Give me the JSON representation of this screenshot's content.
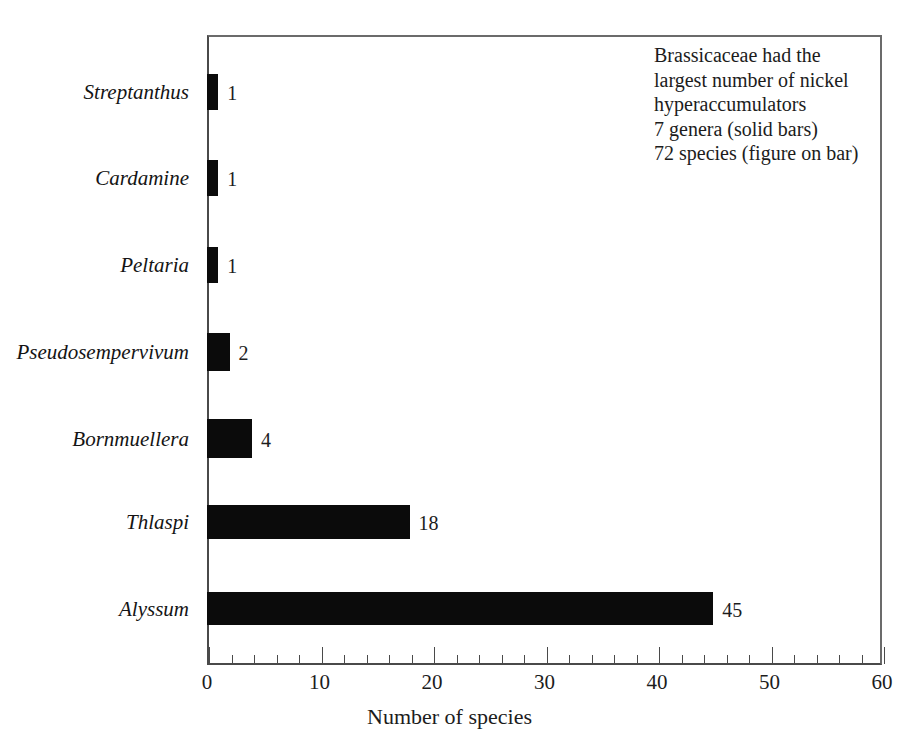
{
  "chart_data": {
    "type": "bar",
    "orientation": "horizontal",
    "title": "",
    "xlabel": "Number of species",
    "ylabel": "",
    "xlim": [
      0,
      60
    ],
    "ylim": null,
    "grid": false,
    "legend": null,
    "x_major_step": 10,
    "x_minor_step": 2,
    "xticks": [
      "0",
      "10",
      "20",
      "30",
      "40",
      "50",
      "60"
    ],
    "xtick_values": [
      0,
      10,
      20,
      30,
      40,
      50,
      60
    ],
    "categories": [
      "Streptanthus",
      "Cardamine",
      "Peltaria",
      "Pseudosempervivum",
      "Bornmuellera",
      "Thlaspi",
      "Alyssum"
    ],
    "values": [
      1,
      1,
      1,
      2,
      4,
      18,
      45
    ],
    "value_labels": [
      "1",
      "1",
      "1",
      "2",
      "4",
      "18",
      "45"
    ],
    "bar_color": "#0b0b0b",
    "background_color": "#ffffff",
    "axis_color": "#4a4a4a",
    "annotations": [
      "Brassicaceae had the",
      "largest number of nickel",
      "hyperaccumulators",
      "7 genera (solid bars)",
      "72 species (figure on bar)"
    ]
  },
  "axis": {
    "x_title": "Number of species"
  }
}
